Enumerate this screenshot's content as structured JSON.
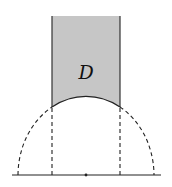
{
  "diagram": {
    "type": "hyperbolic-fundamental-domain",
    "region_label": "D",
    "colors": {
      "region_fill": "#c6c6c6",
      "stroke": "#222222",
      "background": "#ffffff"
    },
    "geometry": {
      "baseline": {
        "x1": 12,
        "x2": 161,
        "y": 175
      },
      "center": {
        "x": 86,
        "y": 175
      },
      "circle": {
        "rx": 68,
        "ry": 79
      },
      "vertical_lines_x": [
        52,
        120
      ],
      "region_top_y": 16,
      "arc_meet_y": 107,
      "label_position": {
        "x": 86,
        "y": 79
      }
    },
    "elements": [
      {
        "name": "shaded-region-D",
        "style": "solid-fill"
      },
      {
        "name": "geodesic-arc",
        "style": "solid"
      },
      {
        "name": "dashed-semicircle",
        "style": "dashed"
      },
      {
        "name": "dashed-vertical-left",
        "style": "dashed"
      },
      {
        "name": "dashed-vertical-right",
        "style": "dashed"
      },
      {
        "name": "real-axis-baseline",
        "style": "solid"
      },
      {
        "name": "origin-dot",
        "style": "point"
      }
    ]
  }
}
